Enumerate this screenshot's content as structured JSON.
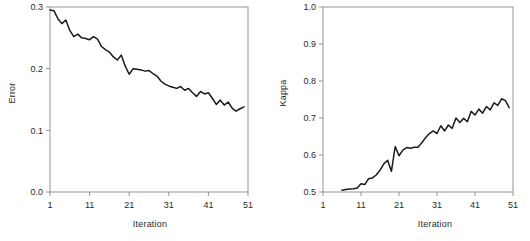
{
  "figure": {
    "background": "#ffffff",
    "line_color": "#1a1a1a",
    "axis_color": "#8a8a8a",
    "text_color": "#2a2a2a",
    "panels": 2
  },
  "chart_data": [
    {
      "type": "line",
      "title": "",
      "xlabel": "Iteration",
      "ylabel": "Error",
      "xlim": [
        1,
        51
      ],
      "ylim": [
        0.0,
        0.3
      ],
      "xticks": [
        1,
        11,
        21,
        31,
        41,
        51
      ],
      "xticklabels": [
        "1",
        "11",
        "21",
        "31",
        "41",
        "51"
      ],
      "yticks": [
        0.0,
        0.1,
        0.2,
        0.3
      ],
      "yticklabels": [
        "0.0",
        "0.1",
        "0.2",
        "0.3"
      ],
      "grid": false,
      "legend": false,
      "series": [
        {
          "name": "Error",
          "x": [
            1,
            2,
            3,
            4,
            5,
            6,
            7,
            8,
            9,
            10,
            11,
            12,
            13,
            14,
            15,
            16,
            17,
            18,
            19,
            20,
            21,
            22,
            23,
            24,
            25,
            26,
            27,
            28,
            29,
            30,
            31,
            32,
            33,
            34,
            35,
            36,
            37,
            38,
            39,
            40,
            41,
            42,
            43,
            44,
            45,
            46,
            47,
            48,
            49,
            50
          ],
          "values": [
            0.295,
            0.294,
            0.281,
            0.273,
            0.279,
            0.262,
            0.252,
            0.256,
            0.25,
            0.249,
            0.247,
            0.252,
            0.248,
            0.236,
            0.231,
            0.227,
            0.219,
            0.214,
            0.222,
            0.204,
            0.191,
            0.2,
            0.199,
            0.198,
            0.196,
            0.197,
            0.192,
            0.188,
            0.18,
            0.175,
            0.172,
            0.17,
            0.168,
            0.171,
            0.165,
            0.168,
            0.161,
            0.155,
            0.163,
            0.159,
            0.161,
            0.152,
            0.142,
            0.149,
            0.141,
            0.146,
            0.136,
            0.131,
            0.135,
            0.138
          ]
        }
      ]
    },
    {
      "type": "line",
      "title": "",
      "xlabel": "Iteration",
      "ylabel": "Kappa",
      "xlim": [
        1,
        51
      ],
      "ylim": [
        0.5,
        1.0
      ],
      "xticks": [
        1,
        11,
        21,
        31,
        41,
        51
      ],
      "xticklabels": [
        "1",
        "11",
        "21",
        "31",
        "41",
        "51"
      ],
      "yticks": [
        0.5,
        0.6,
        0.7,
        0.8,
        0.9,
        1.0
      ],
      "yticklabels": [
        "0.5",
        "0.6",
        "0.7",
        "0.8",
        "0.9",
        "1.0"
      ],
      "grid": false,
      "legend": false,
      "series": [
        {
          "name": "Kappa",
          "x": [
            6,
            7,
            8,
            9,
            10,
            11,
            12,
            13,
            14,
            15,
            16,
            17,
            18,
            19,
            20,
            21,
            22,
            23,
            24,
            25,
            26,
            27,
            28,
            29,
            30,
            31,
            32,
            33,
            34,
            35,
            36,
            37,
            38,
            39,
            40,
            41,
            42,
            43,
            44,
            45,
            46,
            47,
            48,
            49,
            50
          ],
          "values": [
            0.505,
            0.507,
            0.508,
            0.509,
            0.511,
            0.522,
            0.52,
            0.536,
            0.538,
            0.546,
            0.559,
            0.576,
            0.586,
            0.556,
            0.623,
            0.598,
            0.613,
            0.62,
            0.618,
            0.621,
            0.621,
            0.633,
            0.647,
            0.658,
            0.665,
            0.658,
            0.679,
            0.665,
            0.681,
            0.672,
            0.7,
            0.688,
            0.699,
            0.69,
            0.718,
            0.708,
            0.724,
            0.713,
            0.731,
            0.722,
            0.741,
            0.734,
            0.752,
            0.747,
            0.728
          ]
        }
      ]
    }
  ]
}
